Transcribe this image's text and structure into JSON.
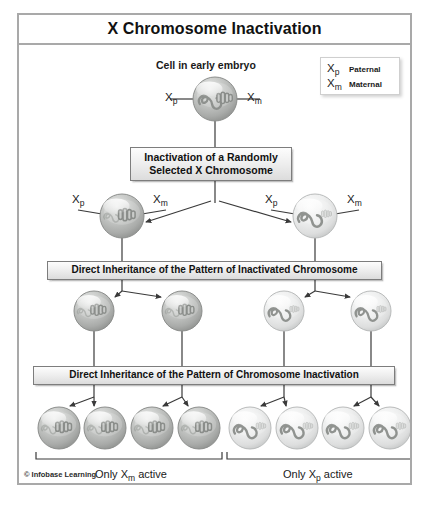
{
  "figure": {
    "title": "X Chromosome Inactivation",
    "copyright": "© Infobase Learning"
  },
  "legend": {
    "rows": [
      {
        "symbol": "X",
        "subscript": "p",
        "name": "Paternal"
      },
      {
        "symbol": "X",
        "subscript": "m",
        "name": "Maternal"
      }
    ]
  },
  "labels": {
    "top_caption": "Cell in early embryo",
    "xp": "X",
    "xp_sub": "p",
    "xm": "X",
    "xm_sub": "m",
    "bracket_left": "Only X",
    "bracket_left_sub": "m",
    "bracket_left_tail": " active",
    "bracket_right": "Only X",
    "bracket_right_sub": "p",
    "bracket_right_tail": " active"
  },
  "boxes": [
    {
      "id": "box-inactivation",
      "line1": "Inactivation of a Randomly",
      "line2": "Selected X Chromosome"
    },
    {
      "id": "box-direct-inheritance-1",
      "line1": "Direct Inheritance of the Pattern of Inactivated Chromosome",
      "line2": ""
    },
    {
      "id": "box-direct-inheritance-2",
      "line1": "Direct Inheritance of the Pattern of Chromosome Inactivation",
      "line2": ""
    }
  ],
  "colors": {
    "frame_border": "#a9a9a9",
    "box_border": "#7d7d7d",
    "connector": "#3a3a3a",
    "cell_dark_fill": "#b0b2b0",
    "cell_light_fill": "#e2e3e3",
    "text": "#111111"
  },
  "cells": {
    "row1": [
      {
        "x": 196,
        "y": 54,
        "r": 22,
        "tone": "dark",
        "content": "both"
      }
    ],
    "row2": [
      {
        "x": 103,
        "y": 171,
        "r": 22,
        "tone": "dark",
        "content": "bar-active"
      },
      {
        "x": 296,
        "y": 171,
        "r": 22,
        "tone": "light",
        "content": "squiggle-active"
      }
    ],
    "row3": [
      {
        "x": 75,
        "y": 266,
        "r": 20,
        "tone": "dark",
        "content": "bar-active"
      },
      {
        "x": 163,
        "y": 266,
        "r": 20,
        "tone": "dark",
        "content": "bar-active"
      },
      {
        "x": 265,
        "y": 266,
        "r": 20,
        "tone": "light",
        "content": "squiggle-active"
      },
      {
        "x": 352,
        "y": 266,
        "r": 20,
        "tone": "light",
        "content": "squiggle-active"
      }
    ],
    "row4": [
      {
        "x": 40,
        "y": 383,
        "r": 21,
        "tone": "dark",
        "content": "bar-active"
      },
      {
        "x": 86,
        "y": 383,
        "r": 21,
        "tone": "dark",
        "content": "bar-active"
      },
      {
        "x": 133,
        "y": 383,
        "r": 21,
        "tone": "dark",
        "content": "bar-active"
      },
      {
        "x": 180,
        "y": 383,
        "r": 21,
        "tone": "dark",
        "content": "bar-active"
      },
      {
        "x": 231,
        "y": 383,
        "r": 21,
        "tone": "light",
        "content": "squiggle-active"
      },
      {
        "x": 278,
        "y": 383,
        "r": 21,
        "tone": "light",
        "content": "squiggle-active"
      },
      {
        "x": 324,
        "y": 383,
        "r": 21,
        "tone": "light",
        "content": "squiggle-active"
      },
      {
        "x": 371,
        "y": 383,
        "r": 21,
        "tone": "light",
        "content": "squiggle-active"
      }
    ]
  }
}
